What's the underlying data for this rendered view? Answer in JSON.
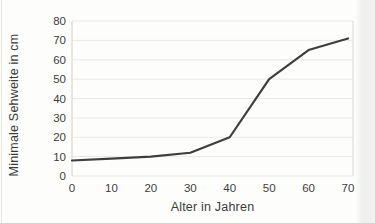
{
  "figure": {
    "background": "#fdfdfc",
    "text_color": "#3b3b3b"
  },
  "chart_data": {
    "type": "line",
    "title": "",
    "xlabel": "Alter in Jahren",
    "ylabel": "Minimale Sehweite in cm",
    "x": [
      0,
      10,
      20,
      30,
      40,
      50,
      60,
      70
    ],
    "y": [
      8,
      9,
      10,
      12,
      20,
      50,
      65,
      71
    ],
    "xlim": [
      0,
      70
    ],
    "ylim": [
      0,
      80
    ],
    "xticks": [
      0,
      10,
      20,
      30,
      40,
      50,
      60,
      70
    ],
    "yticks": [
      0,
      10,
      20,
      30,
      40,
      50,
      60,
      70,
      80
    ],
    "grid": "horizontal",
    "legend": "none",
    "line_color": "#3e3e3e",
    "line_width": 2.2,
    "grid_color": "#ece8e4",
    "axis_color": "#ddd8d2",
    "tick_label_color": "#3d3d3d"
  }
}
